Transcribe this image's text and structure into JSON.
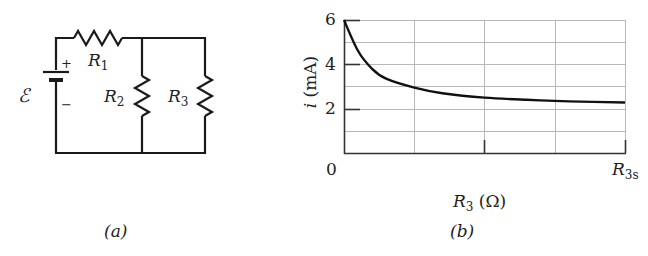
{
  "panel_a": {
    "caption": "(a)",
    "emf_label": "ℰ",
    "plus": "+",
    "minus": "−",
    "r1": {
      "letter": "R",
      "sub": "1"
    },
    "r2": {
      "letter": "R",
      "sub": "2"
    },
    "r3": {
      "letter": "R",
      "sub": "3"
    }
  },
  "panel_b": {
    "caption": "(b)",
    "y_ticks": [
      "6",
      "4",
      "2"
    ],
    "x_start": "0",
    "x_end": {
      "letter": "R",
      "sub": "3s"
    },
    "ylabel": {
      "var": "i",
      "unit": "(mA)"
    },
    "xlabel": {
      "letter": "R",
      "sub": "3",
      "unit": "(Ω)"
    }
  },
  "chart_data": {
    "type": "line",
    "title": "",
    "xlabel": "R3 (Ω)",
    "ylabel": "i (mA)",
    "x_tick_labels": [
      "0",
      "R3s"
    ],
    "y_tick_labels": [
      "2",
      "4",
      "6"
    ],
    "ylim": [
      0,
      6
    ],
    "xlim": [
      0,
      1
    ],
    "grid": true,
    "series": [
      {
        "name": "i vs R3",
        "x": [
          0,
          0.05,
          0.1,
          0.15,
          0.25,
          0.35,
          0.5,
          0.65,
          0.8,
          1.0
        ],
        "values": [
          6.0,
          4.6,
          3.8,
          3.35,
          2.95,
          2.7,
          2.5,
          2.4,
          2.33,
          2.28
        ]
      }
    ],
    "asymptote": 2.2
  }
}
